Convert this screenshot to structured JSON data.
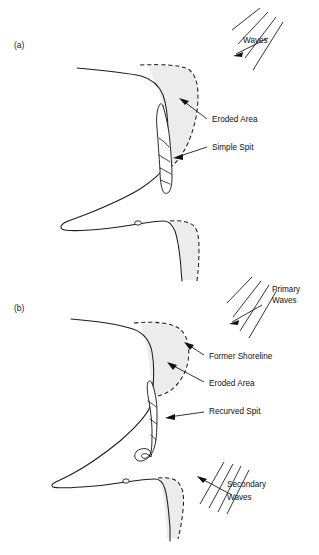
{
  "figure": {
    "width": 319,
    "height": 555,
    "background_color": "#ffffff",
    "ink_color": "#1d1d1d",
    "eroded_area_fill": "#ececec"
  },
  "panels": [
    {
      "id": "panel-a",
      "label": "(a)",
      "label_x": 14,
      "label_y": 48,
      "annotations": [
        {
          "name": "waves",
          "text": "Waves",
          "x": 243,
          "y": 42,
          "lines": [
            "Waves"
          ]
        },
        {
          "name": "eroded-area",
          "text": "Eroded Area",
          "x": 212,
          "y": 118,
          "lines": [
            "Eroded Area"
          ]
        },
        {
          "name": "simple-spit",
          "text": "Simple Spit",
          "x": 212,
          "y": 148,
          "lines": [
            "Simple Spit"
          ]
        }
      ],
      "wave_set": {
        "name": "waves",
        "line_count": 4,
        "arrow_direction": "down-left",
        "label": "Waves"
      },
      "lagoon_marker": {
        "name": "lagoon",
        "label": "0",
        "x": 138,
        "y": 222
      }
    },
    {
      "id": "panel-b",
      "label": "(b)",
      "label_x": 14,
      "label_y": 311,
      "annotations": [
        {
          "name": "primary-waves",
          "text": "Primary Waves",
          "x": 272,
          "y": 288,
          "lines": [
            "Primary",
            "Waves"
          ]
        },
        {
          "name": "former-shoreline",
          "text": "Former Shoreline",
          "x": 209,
          "y": 356,
          "lines": [
            "Former Shoreline"
          ]
        },
        {
          "name": "eroded-area",
          "text": "Eroded Area",
          "x": 209,
          "y": 383,
          "lines": [
            "Eroded Area"
          ]
        },
        {
          "name": "recurved-spit",
          "text": "Recurved Spit",
          "x": 209,
          "y": 410,
          "lines": [
            "Recurved Spit"
          ]
        },
        {
          "name": "secondary-waves",
          "text": "Secondary Waves",
          "x": 227,
          "y": 483,
          "lines": [
            "Secondary",
            "Waves"
          ]
        }
      ],
      "wave_sets": [
        {
          "name": "primary-waves",
          "line_count": 4,
          "arrow_direction": "down-left",
          "label": "Primary Waves"
        },
        {
          "name": "secondary-waves",
          "line_count": 4,
          "arrow_direction": "up-left",
          "label": "Secondary Waves"
        }
      ],
      "lagoon_marker": {
        "name": "lagoon",
        "label": "0",
        "x": 126,
        "y": 478
      }
    }
  ],
  "legend_terms": [
    "Waves",
    "Eroded Area",
    "Simple Spit",
    "Primary Waves",
    "Former Shoreline",
    "Recurved Spit",
    "Secondary Waves"
  ]
}
